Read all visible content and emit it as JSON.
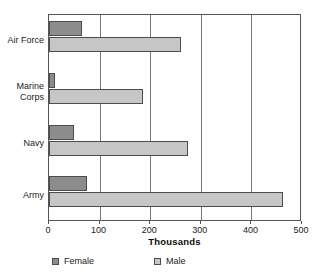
{
  "chart_data": {
    "type": "bar",
    "orientation": "horizontal",
    "title": "",
    "xlabel": "Thousands",
    "ylabel": "",
    "categories": [
      "Air Force",
      "Marine Corps",
      "Navy",
      "Army"
    ],
    "category_lines": [
      [
        "Air Force"
      ],
      [
        "Marine",
        "Corps"
      ],
      [
        "Navy"
      ],
      [
        "Army"
      ]
    ],
    "series": [
      {
        "name": "Female",
        "color": "#8c8c8c",
        "values": [
          65,
          12,
          50,
          75
        ]
      },
      {
        "name": "Male",
        "color": "#c6c6c6",
        "values": [
          260,
          185,
          275,
          462
        ]
      }
    ],
    "xlim": [
      0,
      500
    ],
    "xticks": [
      0,
      100,
      200,
      300,
      400,
      500
    ],
    "xtick_labels": [
      "0",
      "100",
      "200",
      "300",
      "400",
      "500"
    ],
    "grid": "vertical",
    "gridlines": [
      100,
      200,
      300,
      400
    ],
    "legend_position": "bottom",
    "legend": [
      {
        "label": "Female",
        "color": "#8c8c8c"
      },
      {
        "label": "Male",
        "color": "#c6c6c6"
      }
    ]
  }
}
